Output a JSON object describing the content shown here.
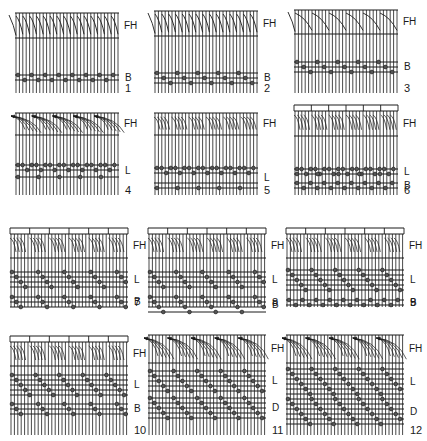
{
  "figure": {
    "ink_color": "#1a1a1a",
    "background": "#ffffff",
    "panels": [
      {
        "number": "1",
        "x": 15,
        "y": 5,
        "w": 104,
        "h": 88,
        "frame": false,
        "fh": {
          "top": 8,
          "bottom": 33,
          "style": "hook"
        },
        "rows": [
          {
            "label": "B",
            "lines": [
              70,
              75
            ],
            "beads": "alt2"
          }
        ]
      },
      {
        "number": "2",
        "x": 154,
        "y": 5,
        "w": 104,
        "h": 88,
        "frame": false,
        "fh": {
          "top": 6,
          "bottom": 31,
          "style": "hook"
        },
        "rows": [
          {
            "label": "B",
            "lines": [
              68,
              73,
              78
            ],
            "beads": "alt3"
          }
        ]
      },
      {
        "number": "3",
        "x": 294,
        "y": 5,
        "w": 104,
        "h": 88,
        "frame": false,
        "fh": {
          "top": 5,
          "bottom": 29,
          "style": "hook_wide"
        },
        "rows": [
          {
            "label": "B",
            "lines": [
              57,
              62,
              67
            ],
            "beads": "alt3"
          }
        ]
      },
      {
        "number": "4",
        "x": 15,
        "y": 110,
        "w": 104,
        "h": 85,
        "frame": false,
        "fh": {
          "top": 3,
          "bottom": 25,
          "style": "fan"
        },
        "rows": [
          {
            "label": "L",
            "lines": [
              55,
              60,
              67
            ],
            "beads": "lingo4"
          }
        ]
      },
      {
        "number": "5",
        "x": 154,
        "y": 110,
        "w": 104,
        "h": 85,
        "frame": false,
        "fh": {
          "top": 3,
          "bottom": 25,
          "style": "zig"
        },
        "rows": [
          {
            "label": "L",
            "lines": [
              58,
              63,
              73,
              78
            ],
            "beads": "lingo5"
          }
        ]
      },
      {
        "number": "6",
        "x": 294,
        "y": 103,
        "w": 104,
        "h": 92,
        "frame": true,
        "fh": {
          "top": 8,
          "bottom": 33,
          "style": "zig"
        },
        "rows": [
          {
            "label": "L",
            "lines": [
              66,
              71
            ],
            "beads": "lingo6"
          },
          {
            "label": "B",
            "lines": [
              80,
              85
            ],
            "beads": "alt2"
          }
        ]
      },
      {
        "number": "7",
        "x": 10,
        "y": 222,
        "w": 118,
        "h": 85,
        "frame": true,
        "fh": {
          "top": 12,
          "bottom": 36,
          "style": "zig"
        },
        "rows": [
          {
            "label": "L",
            "lines": [
              50,
              55,
              60,
              65
            ],
            "beads": "diag4"
          },
          {
            "label": "B",
            "lines": [
              75,
              80,
              85
            ],
            "beads": "diag3"
          }
        ]
      },
      {
        "number": "8",
        "x": 148,
        "y": 222,
        "w": 118,
        "h": 85,
        "frame": true,
        "fh": {
          "top": 12,
          "bottom": 36,
          "style": "zig"
        },
        "rows": [
          {
            "label": "L",
            "lines": [
              50,
              55,
              60,
              65
            ],
            "beads": "diag4"
          },
          {
            "label": "B",
            "lines": [
              75,
              80,
              85,
              90
            ],
            "beads": "diag4"
          }
        ]
      },
      {
        "number": "9",
        "x": 286,
        "y": 222,
        "w": 118,
        "h": 85,
        "frame": true,
        "fh": {
          "top": 12,
          "bottom": 36,
          "style": "zig"
        },
        "rows": [
          {
            "label": "L",
            "lines": [
              48,
              53,
              58,
              63,
              68
            ],
            "beads": "diag5"
          },
          {
            "label": "B",
            "lines": [
              78,
              83
            ],
            "beads": "alt2"
          }
        ]
      },
      {
        "number": "10",
        "x": 10,
        "y": 330,
        "w": 118,
        "h": 105,
        "frame": true,
        "fh": {
          "top": 12,
          "bottom": 36,
          "style": "zig"
        },
        "rows": [
          {
            "label": "L",
            "lines": [
              45,
              50,
              55,
              60,
              65
            ],
            "beads": "diag5"
          },
          {
            "label": "B",
            "lines": [
              74,
              79,
              84
            ],
            "beads": "diag3"
          }
        ]
      },
      {
        "number": "11",
        "x": 148,
        "y": 333,
        "w": 118,
        "h": 102,
        "frame": false,
        "fh": {
          "top": 2,
          "bottom": 30,
          "style": "fan"
        },
        "rows": [
          {
            "label": "L",
            "lines": [
              38,
              43,
              48,
              53,
              58
            ],
            "beads": "diag5"
          },
          {
            "label": "D",
            "lines": [
              65,
              70,
              75,
              80,
              85
            ],
            "beads": "diag5"
          }
        ]
      },
      {
        "number": "12",
        "x": 286,
        "y": 333,
        "w": 118,
        "h": 102,
        "frame": false,
        "fh": {
          "top": 2,
          "bottom": 30,
          "style": "fan"
        },
        "rows": [
          {
            "label": "L",
            "lines": [
              36,
              41,
              46,
              51,
              56,
              61
            ],
            "beads": "diag6"
          },
          {
            "label": "D",
            "lines": [
              66,
              71,
              76,
              81,
              86,
              91
            ],
            "beads": "diag6"
          }
        ]
      }
    ],
    "labels": {
      "frame_heddle": "FH",
      "bead": "B",
      "lingo": "L",
      "draft": "D"
    }
  }
}
